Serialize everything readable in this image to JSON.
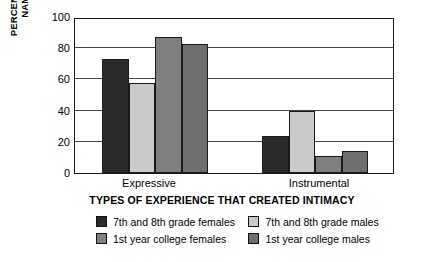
{
  "chart_data": {
    "type": "bar",
    "title": "",
    "xlabel": "TYPES OF EXPERIENCE THAT CREATED INTIMACY",
    "ylabel": "PERCENT WHO NAMED\nEACH TYPE",
    "categories": [
      "Expressive",
      "Instrumental"
    ],
    "ylim": [
      0,
      100
    ],
    "yticks": [
      0,
      20,
      40,
      60,
      80,
      100
    ],
    "grid": true,
    "legend_position": "bottom",
    "series": [
      {
        "name": "7th and 8th grade females",
        "values": [
          73,
          24
        ],
        "color": "#2b2b2b"
      },
      {
        "name": "7th and 8th grade males",
        "values": [
          58,
          40
        ],
        "color": "#cacaca"
      },
      {
        "name": "1st year college females",
        "values": [
          87,
          11
        ],
        "color": "#808080"
      },
      {
        "name": "1st year college males",
        "values": [
          83,
          14
        ],
        "color": "#6e6e6e"
      }
    ]
  },
  "axes": {
    "y_title_line1": "PERCENT WHO NAMED",
    "y_title_line2": "EACH TYPE",
    "y_tick_100": "100",
    "y_tick_80": "80",
    "y_tick_60": "60",
    "y_tick_40": "40",
    "y_tick_20": "20",
    "y_tick_0": "0",
    "x_tick_expressive": "Expressive",
    "x_tick_instrumental": "Instrumental",
    "x_title": "TYPES OF EXPERIENCE THAT CREATED INTIMACY"
  },
  "legend": {
    "items": [
      {
        "label": "7th and 8th grade females",
        "color": "#2b2b2b"
      },
      {
        "label": "7th and 8th grade males",
        "color": "#cacaca"
      },
      {
        "label": "1st year college females",
        "color": "#808080"
      },
      {
        "label": "1st year college males",
        "color": "#6e6e6e"
      }
    ]
  }
}
